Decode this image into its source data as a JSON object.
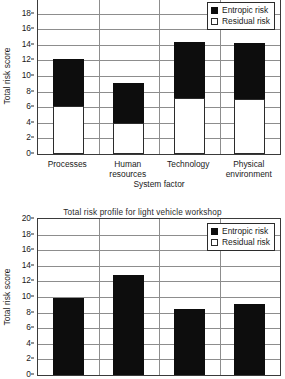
{
  "figures": [
    {
      "id": "top",
      "title": "",
      "legend": {
        "entropic": "Entropic risk",
        "residual": "Residual risk"
      },
      "xaxis_title": "System factor",
      "yaxis_title": "Total risk score"
    },
    {
      "id": "bottom",
      "title": "Total risk profile for light vehicle workshop",
      "legend": {
        "entropic": "Entropic risk",
        "residual": "Residual risk"
      },
      "xaxis_title": "",
      "yaxis_title": "Total risk score"
    }
  ],
  "chart_data": [
    {
      "type": "bar",
      "stacked": true,
      "title": "",
      "xlabel": "System factor",
      "ylabel": "Total risk score",
      "ylim": [
        0,
        20
      ],
      "yticks": [
        0,
        2,
        4,
        6,
        8,
        10,
        12,
        14,
        16,
        18,
        20
      ],
      "grid": true,
      "legend_position": "top-right",
      "categories": [
        "Processes",
        "Human resources",
        "Technology",
        "Physical environment"
      ],
      "series": [
        {
          "name": "Residual risk",
          "color": "#ffffff",
          "values": [
            6.1,
            4.0,
            7.2,
            7.0
          ]
        },
        {
          "name": "Entropic risk",
          "color": "#0d0d0d",
          "values": [
            6.1,
            5.1,
            7.2,
            7.2
          ]
        }
      ],
      "totals": [
        12.2,
        9.1,
        14.4,
        14.2
      ]
    },
    {
      "type": "bar",
      "stacked": true,
      "title": "Total risk profile for light vehicle workshop",
      "xlabel": "",
      "ylabel": "Total risk score",
      "ylim": [
        0,
        20
      ],
      "yticks": [
        0,
        2,
        4,
        6,
        8,
        10,
        12,
        14,
        16,
        18,
        20
      ],
      "grid": true,
      "legend_position": "top-right",
      "categories": [
        "",
        "",
        "",
        ""
      ],
      "series": [
        {
          "name": "Entropic risk",
          "color": "#0d0d0d",
          "values": [
            9.9,
            12.8,
            8.5,
            9.1
          ]
        }
      ],
      "totals": [
        9.9,
        12.8,
        8.5,
        9.1
      ],
      "note": "lower chart is clipped by the bottom edge of the screenshot"
    }
  ]
}
